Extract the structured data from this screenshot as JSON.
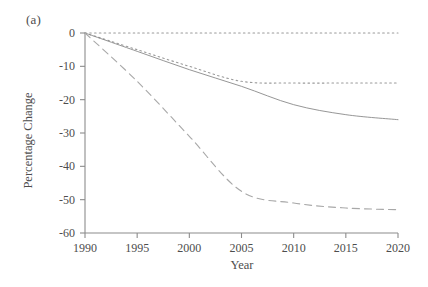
{
  "figure": {
    "panel_label": "(a)",
    "background_color": "#ffffff",
    "axis_color": "#8c8c8c",
    "text_color": "#4d4d4d"
  },
  "chart_data": {
    "type": "line",
    "title": "",
    "subtitle": "",
    "panel": "(a)",
    "xlabel": "Year",
    "ylabel": "Percentage Change",
    "xlim": [
      1990,
      2020
    ],
    "ylim": [
      -60,
      0
    ],
    "grid": false,
    "legend": "none",
    "xticks": [
      1990,
      1995,
      2000,
      2005,
      2010,
      2015,
      2020
    ],
    "xtick_labels": [
      "1990",
      "1995",
      "2000",
      "2005",
      "2010",
      "2015",
      "2020"
    ],
    "yticks": [
      0,
      -10,
      -20,
      -30,
      -40,
      -50,
      -60
    ],
    "ytick_labels": [
      "0",
      "-10",
      "-20",
      "-30",
      "-40",
      "-50",
      "-60"
    ],
    "x": [
      1990,
      1995,
      2000,
      2005,
      2010,
      2015,
      2020
    ],
    "series": [
      {
        "name": "series-1",
        "style": "dotted",
        "color": "#9a9a9a",
        "values": [
          0,
          0,
          0,
          0,
          0,
          0,
          0
        ]
      },
      {
        "name": "series-2",
        "style": "dotted",
        "color": "#9a9a9a",
        "values": [
          0,
          -5,
          -10,
          -14.5,
          -15,
          -15,
          -15
        ]
      },
      {
        "name": "series-3",
        "style": "solid",
        "color": "#8a8a8a",
        "values": [
          0,
          -5.5,
          -11,
          -16,
          -21.5,
          -24.5,
          -26
        ]
      },
      {
        "name": "series-4",
        "style": "dashed",
        "color": "#a8a8a8",
        "values": [
          0,
          -14.5,
          -31,
          -47.5,
          -51,
          -52.5,
          -53
        ]
      }
    ]
  },
  "axes": {
    "ytick_labels": [
      "0",
      "-10",
      "-20",
      "-30",
      "-40",
      "-50",
      "-60"
    ],
    "xtick_labels": [
      "1990",
      "1995",
      "2000",
      "2005",
      "2010",
      "2015",
      "2020"
    ],
    "xlabel": "Year",
    "ylabel": "Percentage Change"
  }
}
